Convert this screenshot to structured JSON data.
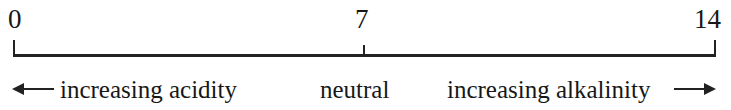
{
  "diagram": {
    "accent_color": "#222222",
    "text_color": "#171717",
    "background_color": "#ffffff",
    "axis": {
      "min": 0,
      "max": 14,
      "neutral": 7,
      "tick_labels": [
        "0",
        "7",
        "14"
      ],
      "tick_values": [
        0,
        7,
        14
      ]
    },
    "ticks": {
      "left_label": "0",
      "center_label": "7",
      "right_label": "14"
    },
    "captions": {
      "acidity": "increasing acidity",
      "neutral": "neutral",
      "alkalinity": "increasing alkalinity"
    },
    "arrows": {
      "left_icon": "arrow-left-icon",
      "right_icon": "arrow-right-icon"
    }
  }
}
